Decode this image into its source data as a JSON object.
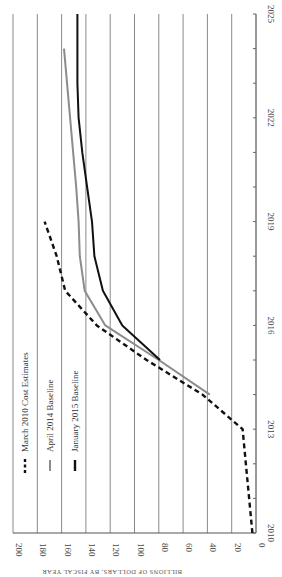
{
  "chart_data": {
    "type": "line",
    "orientation": "rotated-90-clockwise",
    "title": "",
    "xlabel": "",
    "ylabel": "BILLIONS OF DOLLARS, BY FISCAL YEAR",
    "x_ticks": [
      2010,
      2013,
      2016,
      2019,
      2022,
      2025
    ],
    "x_minor_ticks_every": 1,
    "xlim": [
      2010,
      2025
    ],
    "y_ticks": [
      0,
      20,
      40,
      60,
      80,
      100,
      120,
      140,
      160,
      180,
      200
    ],
    "ylim": [
      0,
      200
    ],
    "grid": true,
    "legend_position": "upper-left (rotated)",
    "series": [
      {
        "name": "March 2010 Cost Estimates",
        "style": "dashed",
        "color": "#111111",
        "points": [
          [
            2010,
            3
          ],
          [
            2013,
            11
          ],
          [
            2014,
            44
          ],
          [
            2015,
            90
          ],
          [
            2016,
            131
          ],
          [
            2017,
            157
          ],
          [
            2018,
            164
          ],
          [
            2019,
            174
          ]
        ]
      },
      {
        "name": "April 2014 Baseline",
        "style": "solid",
        "color": "#8c8c8c",
        "points": [
          [
            2014,
            38
          ],
          [
            2015,
            80
          ],
          [
            2016,
            124
          ],
          [
            2017,
            141
          ],
          [
            2018,
            145
          ],
          [
            2019,
            146
          ],
          [
            2020,
            148
          ],
          [
            2022,
            153
          ],
          [
            2024,
            158
          ]
        ]
      },
      {
        "name": "January 2015 Baseline",
        "style": "solid",
        "color": "#111111",
        "points": [
          [
            2015,
            79
          ],
          [
            2016,
            110
          ],
          [
            2017,
            126
          ],
          [
            2018,
            133
          ],
          [
            2019,
            135
          ],
          [
            2020,
            139
          ],
          [
            2021,
            143
          ],
          [
            2022,
            146
          ],
          [
            2023,
            147
          ],
          [
            2024,
            147
          ],
          [
            2025,
            147
          ]
        ]
      }
    ]
  },
  "legend": {
    "items": [
      {
        "label": "March 2010 Cost Estimates",
        "style": "dashed",
        "color": "#111111"
      },
      {
        "label": "April 2014 Baseline",
        "style": "solid",
        "color": "#8c8c8c"
      },
      {
        "label": "January 2015 Baseline",
        "style": "solid",
        "color": "#111111"
      }
    ]
  },
  "axis": {
    "caption": "BILLIONS OF DOLLARS, BY FISCAL YEAR"
  }
}
